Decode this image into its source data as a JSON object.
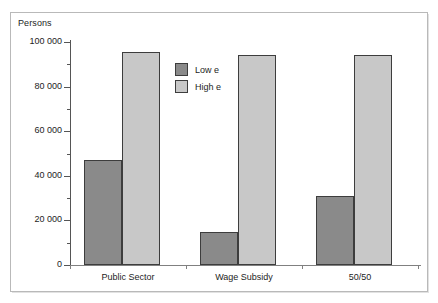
{
  "chart_data": {
    "type": "bar",
    "title": "",
    "subtitle": "",
    "xlabel": "",
    "ylabel": "Persons",
    "categories": [
      "Public Sector",
      "Wage Subsidy",
      "50/50"
    ],
    "series": [
      {
        "name": "Low e",
        "values": [
          47000,
          15000,
          31000
        ],
        "color": "#8a8a8a"
      },
      {
        "name": "High e",
        "values": [
          95500,
          94000,
          94000
        ],
        "color": "#c8c8c8"
      }
    ],
    "ylim": [
      0,
      100000
    ],
    "y_ticks": [
      0,
      20000,
      40000,
      60000,
      80000,
      100000
    ],
    "y_tick_labels": [
      "0",
      "20 000",
      "40 000",
      "60 000",
      "80 000",
      "100 000"
    ],
    "y_minor_ticks": [
      10000,
      30000,
      50000,
      70000,
      90000
    ],
    "grid": false,
    "legend_position": "inside-upper-left-center",
    "legend_entries": [
      "Low e",
      "High e"
    ]
  },
  "axis": {
    "y_title": "Persons"
  },
  "colors": {
    "series_low": "#8a8a8a",
    "series_high": "#c8c8c8",
    "bar_outline": "#3d3d3d",
    "axis": "#555555",
    "frame": "#b9b9b9",
    "text": "#1d1d1d"
  }
}
